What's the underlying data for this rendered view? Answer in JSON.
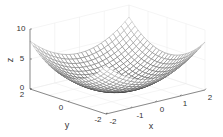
{
  "chart_data": {
    "type": "surface",
    "style": "mesh",
    "function": "z = x^2 + y^2",
    "title": "",
    "xlabel": "x",
    "ylabel": "y",
    "zlabel": "z",
    "xlim": [
      -2,
      2
    ],
    "ylim": [
      -2,
      2
    ],
    "zlim": [
      0,
      10
    ],
    "x_ticks": [
      "-2",
      "-1",
      "0",
      "1",
      "2"
    ],
    "y_ticks": [
      "-2",
      "0",
      "2"
    ],
    "z_ticks": [
      "0",
      "5",
      "10"
    ],
    "grid": true,
    "mesh_resolution": 25,
    "mesh_color": "#4d4d4d",
    "colormap": "gray",
    "sample_points": [
      {
        "x": -2,
        "y": -2,
        "z": 8
      },
      {
        "x": 0,
        "y": 0,
        "z": 0
      },
      {
        "x": 2,
        "y": 2,
        "z": 8
      },
      {
        "x": 2,
        "y": 0,
        "z": 4
      },
      {
        "x": 0,
        "y": 2,
        "z": 4
      }
    ]
  },
  "labels": {
    "x": "x",
    "y": "y",
    "z": "z"
  },
  "ticks": {
    "x": [
      "-2",
      "-1",
      "0",
      "1",
      "2"
    ],
    "y": [
      "-2",
      "0",
      "2"
    ],
    "z": [
      "0",
      "5",
      "10"
    ]
  }
}
